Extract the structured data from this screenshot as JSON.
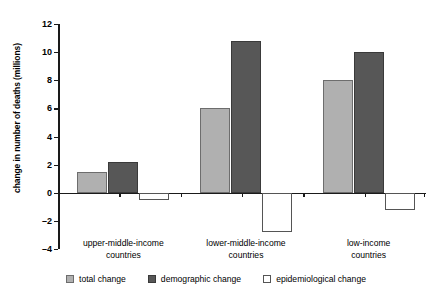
{
  "chart_data": {
    "type": "bar",
    "title": "",
    "xlabel": "",
    "ylabel": "change in number of deaths (millions)",
    "ylim": [
      -4,
      12
    ],
    "yticks": [
      12,
      10,
      8,
      6,
      4,
      2,
      0,
      -2,
      -4
    ],
    "ytick_labels": [
      "12",
      "10",
      "8",
      "6",
      "4",
      "2",
      "0",
      "–2",
      "–4"
    ],
    "grid": false,
    "legend_position": "bottom",
    "categories": [
      "upper-middle-income\ncountries",
      "lower-middle-income\ncountries",
      "low-income\ncountries"
    ],
    "series": [
      {
        "name": "total change",
        "color": "#b0b0b0",
        "values": [
          1.5,
          6.0,
          8.0
        ]
      },
      {
        "name": "demographic change",
        "color": "#575757",
        "values": [
          2.2,
          10.8,
          10.0
        ]
      },
      {
        "name": "epidemiological change",
        "color": "#ffffff",
        "values": [
          -0.5,
          -2.8,
          -1.2
        ]
      }
    ]
  },
  "legend": {
    "items": [
      {
        "label": "total change",
        "swatch": "total"
      },
      {
        "label": "demographic change",
        "swatch": "demographic"
      },
      {
        "label": "epidemiological change",
        "swatch": "epidemiological"
      }
    ]
  }
}
